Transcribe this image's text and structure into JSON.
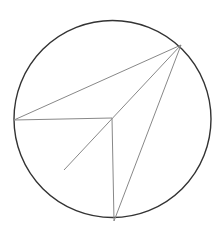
{
  "diagram": {
    "type": "geometry",
    "circle": {
      "cx": 112.5,
      "cy": 119,
      "r": 98.5,
      "stroke": "#333333",
      "stroke_width": 1.4
    },
    "points": {
      "A": {
        "x": 181,
        "y": 45
      },
      "B": {
        "x": 14,
        "y": 120
      },
      "O": {
        "x": 112,
        "y": 118
      },
      "C": {
        "x": 114,
        "y": 221
      },
      "D": {
        "x": 64,
        "y": 170
      }
    },
    "segments": [
      {
        "name": "A-B",
        "from": "A",
        "to": "B"
      },
      {
        "name": "B-O",
        "from": "B",
        "to": "O"
      },
      {
        "name": "A-D",
        "from": "A",
        "to": "D"
      },
      {
        "name": "O-C",
        "from": "O",
        "to": "C"
      },
      {
        "name": "A-C",
        "from": "A",
        "to": "C"
      }
    ],
    "line_color": "#888888"
  }
}
